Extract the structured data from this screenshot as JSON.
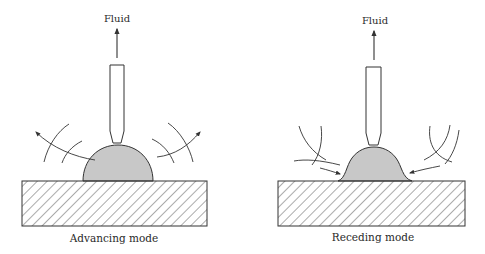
{
  "figure": {
    "panels": [
      {
        "id": "advancing",
        "caption": "Advancing mode",
        "flow_label": "Fluid",
        "flow_direction": "outward",
        "droplet_shape": "spherical-cap"
      },
      {
        "id": "receding",
        "caption": "Receding mode",
        "flow_label": "Fluid",
        "flow_direction": "inward",
        "droplet_shape": "bell"
      }
    ],
    "colors": {
      "stroke": "#333333",
      "droplet_fill": "#c8c8c8",
      "hatch": "#444444",
      "background": "#ffffff"
    }
  }
}
